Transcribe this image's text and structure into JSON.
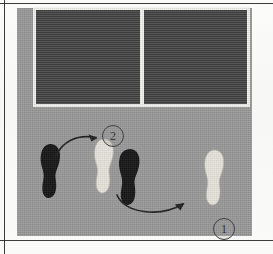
{
  "figure": {
    "panel_color": "#9a9a9a",
    "frame_color": "#f2f2ee",
    "wall_color": "#3f3f3f",
    "page_color": "#fdfdfc",
    "rule_color": "#2a2a2a"
  },
  "wall": {
    "panels": [
      {
        "name": "left-panel"
      },
      {
        "name": "right-panel"
      }
    ]
  },
  "footprints": [
    {
      "id": "left-black-foot",
      "shade": "black",
      "fill": "#141414",
      "side": "left",
      "label": "starting left foot"
    },
    {
      "id": "center-white-foot",
      "shade": "white",
      "fill": "#e8e6dd",
      "side": "left",
      "label": "stepping left foot"
    },
    {
      "id": "center-black-foot",
      "shade": "black",
      "fill": "#141414",
      "side": "right",
      "label": "pivot right foot"
    },
    {
      "id": "right-white-foot",
      "shade": "white",
      "fill": "#e8e6dd",
      "side": "right",
      "label": "landing right foot"
    }
  ],
  "callouts": [
    {
      "id": "callout-1",
      "number": "1",
      "x": 196,
      "y": 210
    },
    {
      "id": "callout-2",
      "number": "2",
      "x": 85,
      "y": 117
    }
  ],
  "arrows": [
    {
      "id": "arrow-1",
      "number": "1",
      "direction": "left-to-right, curving down then up",
      "color": "#1e1e1e"
    },
    {
      "id": "arrow-2",
      "number": "2",
      "direction": "left-to-right, arcing up",
      "color": "#1e1e1e"
    }
  ]
}
